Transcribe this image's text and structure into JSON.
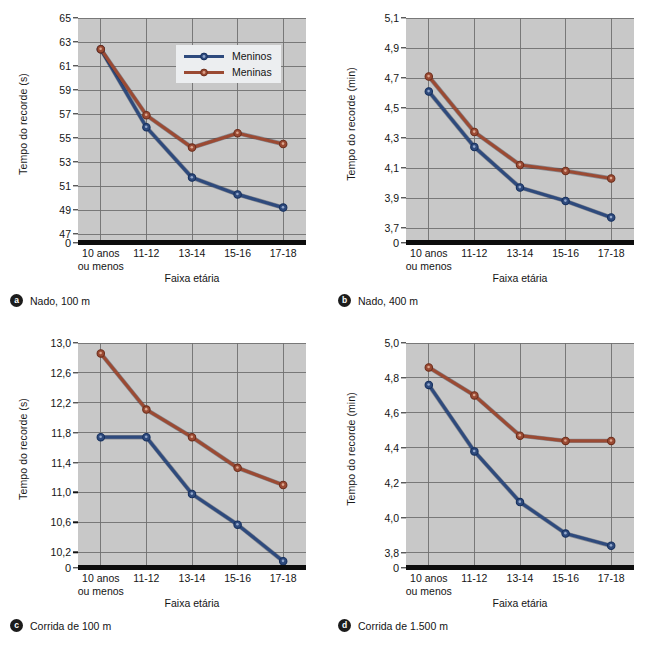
{
  "figure": {
    "legend": {
      "series": [
        {
          "label": "Meninos",
          "color": "#2e4a7d"
        },
        {
          "label": "Meninas",
          "color": "#9b4a33"
        }
      ]
    },
    "categories": [
      "10 anos\nou menos",
      "11-12",
      "13-14",
      "15-16",
      "17-18"
    ],
    "xlabel": "Faixa etária"
  },
  "chart_data": [
    {
      "id": "a",
      "type": "line",
      "badge": "a",
      "caption": "Nado, 100 m",
      "title": "Nado, 100 m",
      "xlabel": "Faixa etária",
      "ylabel": "Tempo do recorde (s)",
      "categories": [
        "10 anos ou menos",
        "11-12",
        "13-14",
        "15-16",
        "17-18"
      ],
      "yticks": [
        "65",
        "63",
        "61",
        "59",
        "57",
        "55",
        "53",
        "51",
        "49",
        "47",
        "0"
      ],
      "ytick_values": [
        65,
        63,
        61,
        59,
        57,
        55,
        53,
        51,
        49,
        47
      ],
      "ylim": [
        46.5,
        65
      ],
      "grid": true,
      "legend_position": "top-right",
      "series": [
        {
          "name": "Meninos",
          "color": "#2e4a7d",
          "values": [
            62.4,
            55.9,
            51.7,
            50.3,
            49.2
          ]
        },
        {
          "name": "Meninas",
          "color": "#9b4a33",
          "values": [
            62.4,
            56.9,
            54.2,
            55.4,
            54.5
          ]
        }
      ]
    },
    {
      "id": "b",
      "type": "line",
      "badge": "b",
      "caption": "Nado, 400 m",
      "title": "Nado, 400 m",
      "xlabel": "Faixa etária",
      "ylabel": "Tempo do recorde (min)",
      "categories": [
        "10 anos ou menos",
        "11-12",
        "13-14",
        "15-16",
        "17-18"
      ],
      "yticks": [
        "5,1",
        "4,9",
        "4,7",
        "4,5",
        "4,3",
        "4,1",
        "3,9",
        "3,7",
        "0"
      ],
      "ytick_values": [
        5.1,
        4.9,
        4.7,
        4.5,
        4.3,
        4.1,
        3.9,
        3.7
      ],
      "ylim": [
        3.62,
        5.1
      ],
      "grid": true,
      "legend_position": "none",
      "series": [
        {
          "name": "Meninos",
          "color": "#2e4a7d",
          "values": [
            4.61,
            4.24,
            3.97,
            3.88,
            3.77
          ]
        },
        {
          "name": "Meninas",
          "color": "#9b4a33",
          "values": [
            4.71,
            4.34,
            4.12,
            4.08,
            4.03
          ]
        }
      ]
    },
    {
      "id": "c",
      "type": "line",
      "badge": "c",
      "caption": "Corrida de 100 m",
      "title": "Corrida de 100 m",
      "xlabel": "Faixa etária",
      "ylabel": "Tempo do recorde (s)",
      "categories": [
        "10 anos ou menos",
        "11-12",
        "13-14",
        "15-16",
        "17-18"
      ],
      "yticks": [
        "13,0",
        "12,6",
        "12,2",
        "11,8",
        "11,4",
        "11,0",
        "10,6",
        "10,2",
        "0"
      ],
      "ytick_values": [
        13.0,
        12.6,
        12.2,
        11.8,
        11.4,
        11.0,
        10.6,
        10.2
      ],
      "ylim": [
        10.03,
        13.0
      ],
      "grid": true,
      "legend_position": "none",
      "series": [
        {
          "name": "Meninos",
          "color": "#2e4a7d",
          "values": [
            11.74,
            11.74,
            10.98,
            10.57,
            10.08
          ]
        },
        {
          "name": "Meninas",
          "color": "#9b4a33",
          "values": [
            12.86,
            12.11,
            11.74,
            11.33,
            11.1
          ]
        }
      ]
    },
    {
      "id": "d",
      "type": "line",
      "badge": "d",
      "caption": "Corrida de 1.500 m",
      "title": "Corrida de 1.500 m",
      "xlabel": "Faixa etária",
      "ylabel": "Tempo do recorde (min)",
      "categories": [
        "10 anos ou menos",
        "11-12",
        "13-14",
        "15-16",
        "17-18"
      ],
      "yticks": [
        "5,0",
        "4,8",
        "4,6",
        "4,4",
        "4,2",
        "4,0",
        "3,8",
        "0"
      ],
      "ytick_values": [
        5.0,
        4.8,
        4.6,
        4.4,
        4.2,
        4.0,
        3.8
      ],
      "ylim": [
        3.73,
        5.0
      ],
      "grid": true,
      "legend_position": "none",
      "series": [
        {
          "name": "Meninos",
          "color": "#2e4a7d",
          "values": [
            4.76,
            4.38,
            4.09,
            3.91,
            3.84
          ]
        },
        {
          "name": "Meninas",
          "color": "#9b4a33",
          "values": [
            4.86,
            4.7,
            4.47,
            4.44,
            4.44
          ]
        }
      ]
    }
  ]
}
